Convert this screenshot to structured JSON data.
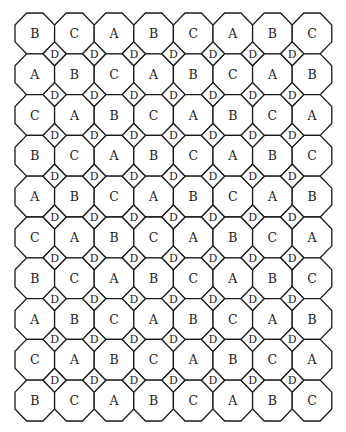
{
  "diagram": {
    "grid": {
      "rows": 10,
      "cols": 8,
      "origin_x": 15,
      "origin_y": 13,
      "pitch_x": 39.6,
      "pitch_y": 40.8
    },
    "octagon_labels": [
      [
        "B",
        "C",
        "A",
        "B",
        "C",
        "A",
        "B",
        "C"
      ],
      [
        "A",
        "B",
        "C",
        "A",
        "B",
        "C",
        "A",
        "B"
      ],
      [
        "C",
        "A",
        "B",
        "C",
        "A",
        "B",
        "C",
        "A"
      ],
      [
        "B",
        "C",
        "A",
        "B",
        "C",
        "A",
        "B",
        "C"
      ],
      [
        "A",
        "B",
        "C",
        "A",
        "B",
        "C",
        "A",
        "B"
      ],
      [
        "C",
        "A",
        "B",
        "C",
        "A",
        "B",
        "C",
        "A"
      ],
      [
        "B",
        "C",
        "A",
        "B",
        "C",
        "A",
        "B",
        "C"
      ],
      [
        "A",
        "B",
        "C",
        "A",
        "B",
        "C",
        "A",
        "B"
      ],
      [
        "C",
        "A",
        "B",
        "C",
        "A",
        "B",
        "C",
        "A"
      ],
      [
        "B",
        "C",
        "A",
        "B",
        "C",
        "A",
        "B",
        "C"
      ]
    ],
    "square_label": "D",
    "square_rows": 9,
    "square_cols": 7,
    "colors": {
      "stroke": "#1a1a1a",
      "fill": "#ffffff",
      "text": "#222222"
    }
  }
}
